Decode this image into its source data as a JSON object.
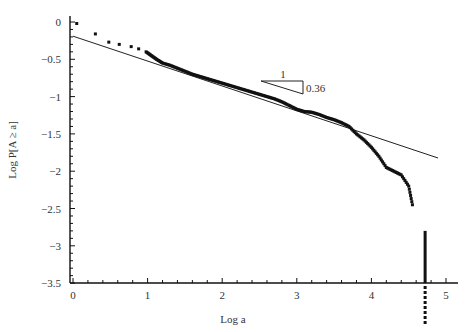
{
  "chart_data": {
    "type": "scatter",
    "title": "",
    "xlabel": "Log a",
    "ylabel": "Log P[A ≥ a]",
    "xlim": [
      0,
      5
    ],
    "ylim": [
      -3.5,
      0
    ],
    "grid": false,
    "legend": null,
    "x_ticks": [
      "0",
      "1",
      "2",
      "3",
      "4",
      "5"
    ],
    "y_ticks": [
      "0",
      "−0.5",
      "−1",
      "−1.5",
      "−2",
      "−2.5",
      "−3",
      "−3.5"
    ],
    "series": [
      {
        "name": "empirical CCDF",
        "style": "points",
        "x": [
          0.05,
          0.3,
          0.48,
          0.62,
          0.78,
          0.88,
          0.98,
          1.05,
          1.12,
          1.2,
          1.3,
          1.4,
          1.5,
          1.6,
          1.7,
          1.8,
          1.9,
          2.0,
          2.1,
          2.2,
          2.3,
          2.4,
          2.5,
          2.6,
          2.7,
          2.8,
          2.9,
          3.0,
          3.1,
          3.2,
          3.3,
          3.4,
          3.5,
          3.6,
          3.7,
          3.8,
          3.9,
          4.0,
          4.1,
          4.2,
          4.3,
          4.4,
          4.5,
          4.55
        ],
        "y": [
          -0.02,
          -0.16,
          -0.27,
          -0.3,
          -0.33,
          -0.36,
          -0.4,
          -0.45,
          -0.5,
          -0.55,
          -0.58,
          -0.62,
          -0.66,
          -0.7,
          -0.73,
          -0.76,
          -0.79,
          -0.82,
          -0.85,
          -0.88,
          -0.91,
          -0.94,
          -0.97,
          -1.0,
          -1.03,
          -1.07,
          -1.12,
          -1.17,
          -1.2,
          -1.21,
          -1.24,
          -1.28,
          -1.31,
          -1.35,
          -1.4,
          -1.5,
          -1.58,
          -1.68,
          -1.8,
          -1.95,
          -2.0,
          -2.05,
          -2.2,
          -2.45
        ]
      },
      {
        "name": "tail drop",
        "style": "vertical-segment",
        "x": [
          4.72,
          4.72,
          4.72
        ],
        "y": [
          -2.45,
          -3.5,
          -4.2
        ]
      },
      {
        "name": "power-law fit",
        "style": "line",
        "x": [
          0,
          5
        ],
        "y": [
          -0.19,
          -1.85
        ]
      }
    ],
    "annotations": [
      {
        "type": "slope-triangle",
        "run_label": "1",
        "rise_label": "0.36",
        "slope": -0.36
      }
    ]
  }
}
